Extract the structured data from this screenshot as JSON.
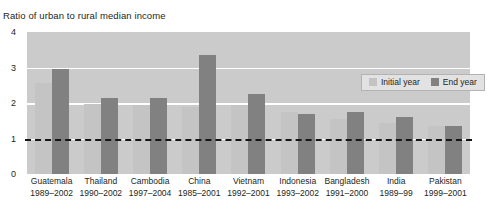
{
  "chart_data": {
    "type": "bar",
    "title": "Ratio of urban to rural median income",
    "xlabel": "",
    "ylabel": "",
    "ylim": [
      0,
      4
    ],
    "yticks": [
      0,
      1,
      2,
      3,
      4
    ],
    "ytick_labels": [
      "0",
      "1",
      "2",
      "3",
      "4"
    ],
    "grid": "horizontal gridlines at 1, 2, 3 (white)",
    "reference_line": {
      "value": 1,
      "style": "dashed",
      "color": "#151515"
    },
    "legend": {
      "position": "top-right inside plot",
      "entries": [
        "Initial year",
        "End year"
      ]
    },
    "categories": [
      "Guatemala",
      "Thailand",
      "Cambodia",
      "China",
      "Vietnam",
      "Indonesia",
      "Bangladesh",
      "India",
      "Pakistan"
    ],
    "category_years": [
      "1989–2002",
      "1990–2002",
      "1997–2004",
      "1985–2001",
      "1992–2001",
      "1993–2002",
      "1991–2000",
      "1989–99",
      "1999–2001"
    ],
    "series": [
      {
        "name": "Initial year",
        "color": "#c4c4c4",
        "values": [
          2.55,
          1.97,
          1.95,
          1.9,
          1.95,
          1.75,
          1.55,
          1.45,
          1.35
        ]
      },
      {
        "name": "End year",
        "color": "#818181",
        "values": [
          2.95,
          2.13,
          2.15,
          3.35,
          2.25,
          1.68,
          1.75,
          1.62,
          1.35
        ]
      }
    ],
    "colors": {
      "plot_background": "#cbcbcb",
      "gridline": "#ffffff",
      "initial_year": "#c4c4c4",
      "end_year": "#818181",
      "text": "#231f20",
      "legend_background": "#e2e2e2",
      "legend_border": "#b3b3b3"
    }
  }
}
